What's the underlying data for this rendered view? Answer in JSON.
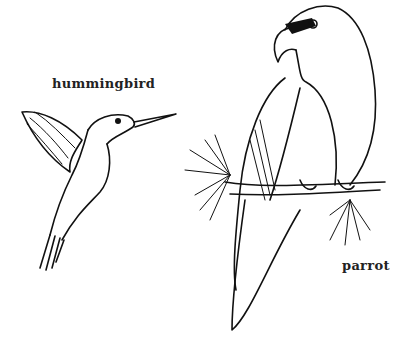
{
  "illustration": {
    "labels": {
      "hummingbird": "hummingbird",
      "parrot": "parrot"
    },
    "style": "black-and-white line drawing",
    "colors": {
      "ink": "#111111",
      "background": "#ffffff"
    }
  }
}
